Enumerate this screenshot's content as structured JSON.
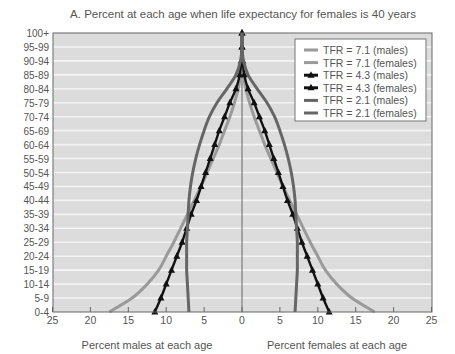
{
  "chart_data": {
    "type": "line",
    "title": "A. Percent at each age when life expectancy for females is 40 years",
    "xlabel_left": "Percent males at each age",
    "xlabel_right": "Percent females at each age",
    "ylabel": "",
    "x_ticks_left": [
      "25",
      "20",
      "15",
      "10",
      "5",
      "0"
    ],
    "x_ticks_right": [
      "5",
      "10",
      "15",
      "20",
      "25"
    ],
    "xlim": [
      -25,
      25
    ],
    "categories": [
      "0-4",
      "5-9",
      "10-14",
      "15-19",
      "20-24",
      "25-29",
      "30-34",
      "35-39",
      "40-44",
      "45-49",
      "50-54",
      "55-59",
      "60-64",
      "65-69",
      "70-74",
      "75-79",
      "80-84",
      "85-89",
      "90-94",
      "95-99",
      "100+"
    ],
    "grid": true,
    "legend_position": "upper right",
    "series": [
      {
        "name": "TFR = 7.1 (males)",
        "side": "left",
        "color": "#9a9a9a",
        "marker": "none",
        "values": [
          17.5,
          14.5,
          12.5,
          11.0,
          10.0,
          9.0,
          8.1,
          7.2,
          6.3,
          5.4,
          4.6,
          3.8,
          3.0,
          2.3,
          1.6,
          1.0,
          0.5,
          0.2,
          0.05,
          0.0,
          0.0
        ]
      },
      {
        "name": "TFR = 7.1 (females)",
        "side": "right",
        "color": "#9a9a9a",
        "marker": "none",
        "values": [
          17.5,
          14.5,
          12.5,
          11.0,
          10.0,
          9.0,
          8.1,
          7.2,
          6.3,
          5.4,
          4.6,
          3.8,
          3.0,
          2.3,
          1.6,
          1.0,
          0.5,
          0.2,
          0.05,
          0.0,
          0.0
        ]
      },
      {
        "name": "TFR = 4.3 (males)",
        "side": "left",
        "color": "#111111",
        "marker": "triangle",
        "values": [
          11.5,
          10.7,
          10.0,
          9.3,
          8.6,
          7.9,
          7.3,
          6.7,
          6.0,
          5.4,
          4.8,
          4.2,
          3.6,
          3.0,
          2.3,
          1.6,
          0.8,
          0.3,
          0.1,
          0.0,
          0.0
        ]
      },
      {
        "name": "TFR = 4.3 (females)",
        "side": "right",
        "color": "#111111",
        "marker": "triangle",
        "values": [
          11.5,
          10.7,
          10.0,
          9.3,
          8.6,
          7.9,
          7.3,
          6.7,
          6.0,
          5.4,
          4.8,
          4.2,
          3.6,
          3.0,
          2.3,
          1.6,
          0.8,
          0.3,
          0.1,
          0.0,
          0.0
        ]
      },
      {
        "name": "TFR = 2.1 (males)",
        "side": "left",
        "color": "#666666",
        "marker": "none",
        "values": [
          7.0,
          7.1,
          7.2,
          7.3,
          7.3,
          7.3,
          7.2,
          7.1,
          7.0,
          6.8,
          6.5,
          6.1,
          5.6,
          5.0,
          4.3,
          3.3,
          2.0,
          0.8,
          0.2,
          0.0,
          0.0
        ]
      },
      {
        "name": "TFR = 2.1 (females)",
        "side": "right",
        "color": "#666666",
        "marker": "none",
        "values": [
          7.0,
          7.1,
          7.2,
          7.3,
          7.3,
          7.3,
          7.2,
          7.1,
          7.0,
          6.8,
          6.5,
          6.1,
          5.6,
          5.0,
          4.3,
          3.3,
          2.0,
          0.8,
          0.2,
          0.0,
          0.0
        ]
      }
    ]
  },
  "colors": {
    "plot_bg": "#dcdcdc",
    "gridline": "#f4f4f4",
    "axis": "#666666",
    "text": "#555555"
  }
}
